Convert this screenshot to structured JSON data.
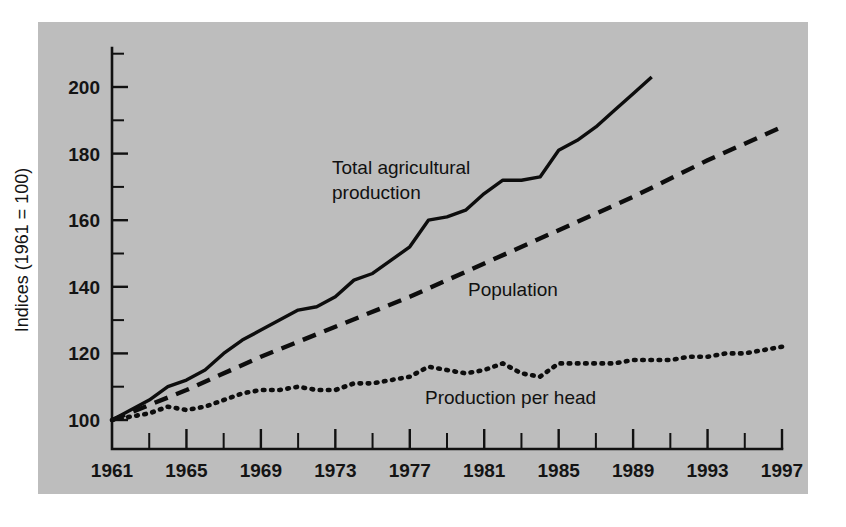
{
  "figure": {
    "background_color": "#ffffff",
    "panel_color": "#bdbdbd",
    "ink_color": "#111111"
  },
  "axes": {
    "y_title": "Indices (1961 = 100)",
    "y_tick_labels": [
      "100",
      "120",
      "140",
      "160",
      "180",
      "200"
    ],
    "x_tick_labels": [
      "1961",
      "1965",
      "1969",
      "1973",
      "1977",
      "1981",
      "1985",
      "1989",
      "1993",
      "1997"
    ]
  },
  "annotations": {
    "total_production": "Total agricultural production",
    "total_production_line1": "Total agricultural",
    "total_production_line2": "production",
    "population": "Population",
    "production_per_head": "Production per head"
  },
  "chart_data": {
    "type": "line",
    "title": "",
    "subtitle": "",
    "xlabel": "",
    "ylabel": "Indices (1961 = 100)",
    "xlim": [
      1961,
      1997
    ],
    "ylim": [
      100,
      210
    ],
    "grid": false,
    "legend": "inline-annotations",
    "y_ticks_major": [
      100,
      120,
      140,
      160,
      180,
      200
    ],
    "y_ticks_minor": [
      110,
      130,
      150,
      170,
      190,
      210
    ],
    "x_ticks_major": [
      1961,
      1965,
      1969,
      1973,
      1977,
      1981,
      1985,
      1989,
      1993,
      1997
    ],
    "x_ticks_minor": [
      1963,
      1967,
      1971,
      1975,
      1979,
      1983,
      1987,
      1991,
      1995
    ],
    "series": [
      {
        "name": "Total agricultural production",
        "style": "solid",
        "x": [
          1961,
          1962,
          1963,
          1964,
          1965,
          1966,
          1967,
          1968,
          1969,
          1970,
          1971,
          1972,
          1973,
          1974,
          1975,
          1976,
          1977,
          1978,
          1979,
          1980,
          1981,
          1982,
          1983,
          1984,
          1985,
          1986,
          1987,
          1988,
          1989,
          1990
        ],
        "values": [
          100,
          103,
          106,
          110,
          112,
          115,
          120,
          124,
          127,
          130,
          133,
          134,
          137,
          142,
          144,
          148,
          152,
          160,
          161,
          163,
          168,
          172,
          172,
          173,
          181,
          184,
          188,
          193,
          198,
          203
        ]
      },
      {
        "name": "Population",
        "style": "dashed",
        "x": [
          1961,
          1965,
          1969,
          1973,
          1977,
          1981,
          1985,
          1989,
          1993,
          1997
        ],
        "values": [
          100,
          109,
          119,
          128,
          137,
          147,
          157,
          167,
          178,
          188
        ]
      },
      {
        "name": "Production per head",
        "style": "dotted",
        "x": [
          1961,
          1962,
          1963,
          1964,
          1965,
          1966,
          1967,
          1968,
          1969,
          1970,
          1971,
          1972,
          1973,
          1974,
          1975,
          1976,
          1977,
          1978,
          1979,
          1980,
          1981,
          1982,
          1983,
          1984,
          1985,
          1986,
          1987,
          1988,
          1989,
          1990,
          1991,
          1992,
          1993,
          1994,
          1995,
          1996,
          1997
        ],
        "values": [
          100,
          101,
          102,
          104,
          103,
          104,
          106,
          108,
          109,
          109,
          110,
          109,
          109,
          111,
          111,
          112,
          113,
          116,
          115,
          114,
          115,
          117,
          114,
          113,
          117,
          117,
          117,
          117,
          118,
          118,
          118,
          119,
          119,
          120,
          120,
          121,
          122
        ]
      }
    ]
  }
}
